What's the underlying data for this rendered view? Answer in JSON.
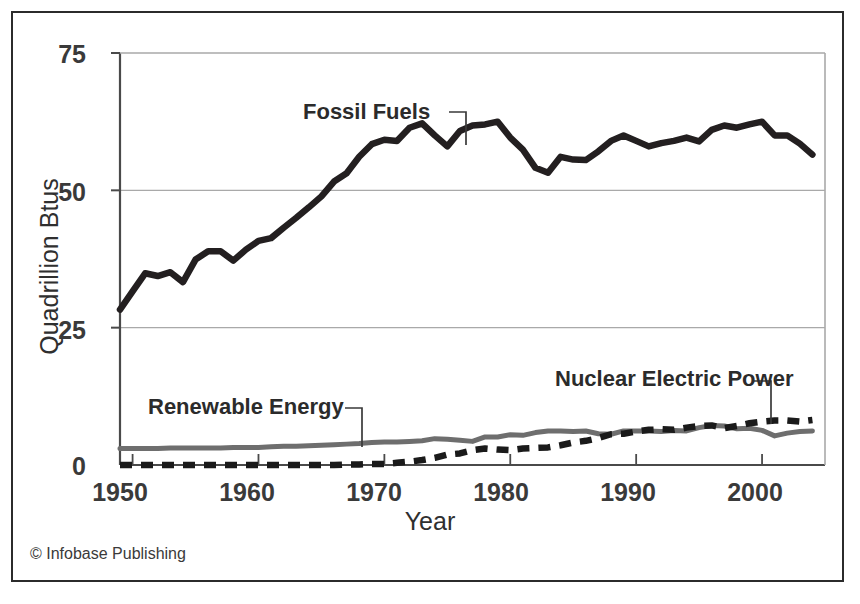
{
  "credit": "© Infobase Publishing",
  "axes": {
    "y_title": "Quadrillion Btus",
    "x_title": "Year",
    "y_ticks": [
      "0",
      "25",
      "50",
      "75"
    ],
    "x_ticks": [
      "1950",
      "1960",
      "1970",
      "1980",
      "1990",
      "2000"
    ]
  },
  "labels": {
    "fossil": "Fossil Fuels",
    "renewable": "Renewable Energy",
    "nuclear": "Nuclear Electric Power"
  },
  "colors": {
    "fossil": "#231f20",
    "renewable": "#6e6e6e",
    "nuclear": "#1a1a1a",
    "grid": "#a9a9a9",
    "axis": "#4a4a4a",
    "frame": "#2b2b2b",
    "text": "#2f2f2f"
  },
  "chart_data": {
    "type": "line",
    "title": "",
    "xlabel": "Year",
    "ylabel": "Quadrillion Btus",
    "xlim": [
      1949,
      2005
    ],
    "ylim": [
      0,
      75
    ],
    "yticks": [
      0,
      25,
      50,
      75
    ],
    "xticks": [
      1950,
      1960,
      1970,
      1980,
      1990,
      2000
    ],
    "grid": "horizontal",
    "legend": "inline-annotations",
    "x": [
      1949,
      1950,
      1951,
      1952,
      1953,
      1954,
      1955,
      1956,
      1957,
      1958,
      1959,
      1960,
      1961,
      1962,
      1963,
      1964,
      1965,
      1966,
      1967,
      1968,
      1969,
      1970,
      1971,
      1972,
      1973,
      1974,
      1975,
      1976,
      1977,
      1978,
      1979,
      1980,
      1981,
      1982,
      1983,
      1984,
      1985,
      1986,
      1987,
      1988,
      1989,
      1990,
      1991,
      1992,
      1993,
      1994,
      1995,
      1996,
      1997,
      1998,
      1999,
      2000,
      2001,
      2002,
      2003,
      2004
    ],
    "series": [
      {
        "name": "Fossil Fuels",
        "style": "solid-thick",
        "color": "#231f20",
        "values": [
          28.3,
          31.6,
          34.9,
          34.4,
          35.1,
          33.3,
          37.4,
          38.9,
          38.9,
          37.2,
          39.2,
          40.8,
          41.3,
          43.2,
          45.0,
          46.9,
          48.9,
          51.6,
          53.1,
          56.1,
          58.4,
          59.2,
          59.0,
          61.4,
          62.2,
          60.0,
          58.0,
          60.8,
          61.8,
          62.0,
          62.5,
          59.6,
          57.4,
          54.1,
          53.2,
          56.1,
          55.6,
          55.5,
          57.1,
          59.0,
          60.0,
          59.0,
          58.0,
          58.6,
          59.0,
          59.6,
          58.9,
          61.0,
          61.8,
          61.4,
          62.0,
          62.5,
          60.0,
          60.0,
          58.5,
          56.5
        ]
      },
      {
        "name": "Renewable Energy",
        "style": "solid-gray",
        "color": "#6e6e6e",
        "values": [
          3.0,
          3.0,
          3.0,
          3.0,
          3.1,
          3.1,
          3.1,
          3.1,
          3.1,
          3.2,
          3.2,
          3.2,
          3.3,
          3.4,
          3.4,
          3.5,
          3.6,
          3.7,
          3.8,
          3.9,
          4.1,
          4.2,
          4.2,
          4.3,
          4.4,
          4.8,
          4.7,
          4.5,
          4.3,
          5.1,
          5.1,
          5.5,
          5.4,
          5.9,
          6.2,
          6.2,
          6.1,
          6.2,
          5.7,
          5.6,
          6.2,
          6.2,
          6.2,
          6.1,
          6.3,
          6.2,
          6.8,
          7.2,
          7.1,
          6.6,
          6.7,
          6.3,
          5.3,
          5.8,
          6.1,
          6.2
        ]
      },
      {
        "name": "Nuclear Electric Power",
        "style": "dashed-thick",
        "color": "#1a1a1a",
        "values": [
          0.0,
          0.0,
          0.0,
          0.0,
          0.0,
          0.0,
          0.0,
          0.0,
          0.0,
          0.0,
          0.0,
          0.0,
          0.0,
          0.0,
          0.0,
          0.0,
          0.0,
          0.0,
          0.1,
          0.1,
          0.2,
          0.2,
          0.4,
          0.6,
          0.9,
          1.3,
          1.9,
          2.1,
          2.7,
          3.0,
          2.8,
          2.7,
          3.0,
          3.1,
          3.2,
          3.6,
          4.1,
          4.4,
          4.9,
          5.6,
          5.7,
          6.1,
          6.4,
          6.5,
          6.4,
          6.8,
          7.1,
          7.2,
          6.7,
          7.1,
          7.6,
          7.9,
          8.1,
          8.1,
          7.9,
          8.2
        ]
      }
    ]
  }
}
